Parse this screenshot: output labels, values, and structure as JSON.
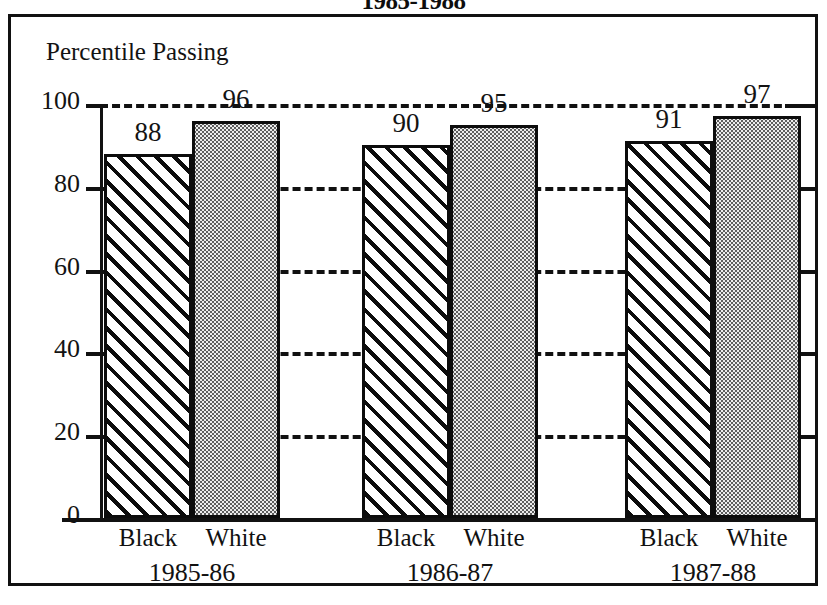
{
  "chart_data": {
    "type": "bar",
    "title": "1985-1988",
    "title_note": "title is cropped at the top edge of the screenshot",
    "ylabel": "Percentile Passing",
    "xlabel": "",
    "categories": [
      "1985-86",
      "1986-87",
      "1987-88"
    ],
    "series": [
      {
        "name": "Black",
        "values": [
          88,
          90,
          91
        ],
        "fill": "diagonal-hatch"
      },
      {
        "name": "White",
        "values": [
          96,
          95,
          97
        ],
        "fill": "dot-stipple"
      }
    ],
    "ylim": [
      0,
      100
    ],
    "yticks": [
      0,
      20,
      40,
      60,
      80,
      100
    ],
    "ytick_labels": [
      "0",
      "20",
      "40",
      "60",
      "80",
      "100"
    ],
    "grid": true,
    "grid_style": "dashed-horizontal",
    "legend": "none",
    "value_labels_shown": true,
    "colors": {
      "ink": "#111111",
      "background": "#ffffff",
      "stipple_fill": "#ececec",
      "stipple_dot": "#5d5d5d"
    }
  },
  "axis_caption": "Percentile Passing",
  "groups": [
    {
      "period": "1985-86",
      "bars": [
        {
          "label": "Black",
          "value": 88,
          "value_text": "88"
        },
        {
          "label": "White",
          "value": 96,
          "value_text": "96"
        }
      ]
    },
    {
      "period": "1986-87",
      "bars": [
        {
          "label": "Black",
          "value": 90,
          "value_text": "90"
        },
        {
          "label": "White",
          "value": 95,
          "value_text": "95"
        }
      ]
    },
    {
      "period": "1987-88",
      "bars": [
        {
          "label": "Black",
          "value": 91,
          "value_text": "91"
        },
        {
          "label": "White",
          "value": 97,
          "value_text": "97"
        }
      ]
    }
  ],
  "yticks": [
    {
      "text": "100",
      "value": 100
    },
    {
      "text": "80",
      "value": 80
    },
    {
      "text": "60",
      "value": 60
    },
    {
      "text": "40",
      "value": 40
    },
    {
      "text": "20",
      "value": 20
    },
    {
      "text": "0",
      "value": 0
    }
  ]
}
